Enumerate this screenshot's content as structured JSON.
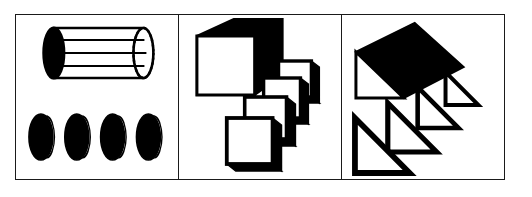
{
  "figure": {
    "background_color": "#ffffff",
    "ink_color": "#000000",
    "border_color": "#1a1a1a",
    "panel_count": 3
  },
  "panels": [
    {
      "id": "panel-cylinder",
      "label": "Cylinder decomposed into circular discs",
      "solid": {
        "name": "cylinder",
        "shading": "black-end-cap-with-ruled-body",
        "slice_lines": 3,
        "hidden_edge_style": "dotted"
      },
      "slices": {
        "name": "circular-disc",
        "count": 4,
        "fill": "#000000",
        "highlight": "#ffffff",
        "shape": "ellipse"
      }
    },
    {
      "id": "panel-cube",
      "label": "Rectangular prism decomposed into square plates",
      "solid": {
        "name": "cube",
        "front_face_fill": "#ffffff",
        "top_face_fill": "#000000",
        "side_face_fill": "#000000"
      },
      "slices": {
        "name": "square-plate",
        "count": 4,
        "fill": "#ffffff",
        "outline": "#000000",
        "shape": "square",
        "arrangement": "cascade-down-left"
      }
    },
    {
      "id": "panel-wedge",
      "label": "Triangular prism decomposed into triangular plates",
      "solid": {
        "name": "triangular-prism",
        "top_face_fill": "#000000",
        "end_face_fill": "#ffffff"
      },
      "slices": {
        "name": "triangle-plate",
        "count": 4,
        "fill": "#ffffff",
        "outline": "#000000",
        "shape": "right-triangle",
        "arrangement": "decreasing-size-diagonal"
      }
    }
  ]
}
